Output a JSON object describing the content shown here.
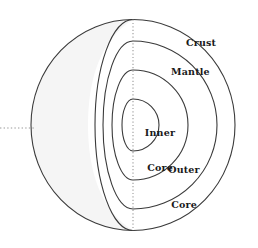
{
  "diagram": {
    "type": "cross-section",
    "labels": {
      "crust": "Crust",
      "mantle": "Mantle",
      "inner_core_line1": "Inner",
      "inner_core_line2": "Core",
      "outer_core_line1": "Outer",
      "outer_core_line2": "Core"
    },
    "colors": {
      "stroke": "#3a3a3a",
      "fill_shade": "#f4f4f4",
      "background": "#ffffff",
      "label_text": "#1a1a1a",
      "dotted_axis": "#9a9a9a"
    },
    "geometry": {
      "sphere_center_x": 133,
      "sphere_center_y": 125,
      "sphere_radius_x": 103,
      "sphere_radius_y": 106,
      "crust_cut_radius": 103,
      "mantle_radius": 84,
      "outer_core_radius": 55,
      "inner_core_radius": 26,
      "cut_ellipse_rx_crust": 36,
      "cut_ellipse_rx_mantle": 28,
      "cut_ellipse_rx_outer": 20,
      "cut_ellipse_rx_inner": 11
    },
    "axes": {
      "vertical_dotted": "polar-axis",
      "horizontal_dotted": "equatorial-axis"
    }
  }
}
